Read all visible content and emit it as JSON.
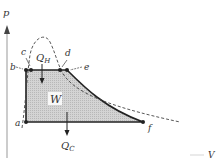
{
  "diagram": {
    "type": "pV-cycle",
    "axes": {
      "y_label": "p",
      "x_label": "V"
    },
    "points": [
      {
        "id": "a",
        "label": "a"
      },
      {
        "id": "b",
        "label": "b"
      },
      {
        "id": "c",
        "label": "c"
      },
      {
        "id": "d",
        "label": "d"
      },
      {
        "id": "e",
        "label": "e"
      },
      {
        "id": "f",
        "label": "f"
      }
    ],
    "labels": {
      "heat_in": "Q",
      "heat_in_sub": "H",
      "work": "W",
      "heat_out": "Q",
      "heat_out_sub": "C"
    },
    "colors": {
      "line": "#222222",
      "fill": "#cfcfcf",
      "dashed": "#444444"
    }
  }
}
